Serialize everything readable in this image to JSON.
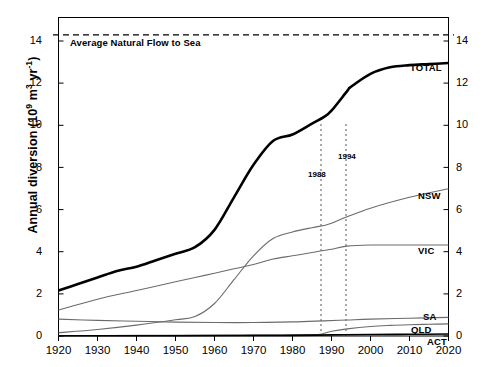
{
  "chart_data": {
    "type": "line",
    "title": "",
    "xlabel": "",
    "ylabel": "Annual diversion (10⁹ m³ yr⁻¹)",
    "ylabel_parts": {
      "pre": "Annual diversion (10",
      "sup1": "9",
      "mid": " m",
      "sup2": "3",
      "mid2": " yr",
      "sup3": "-1",
      "post": ")"
    },
    "xlim": [
      1920,
      2020
    ],
    "ylim": [
      0,
      14.7
    ],
    "xticks": [
      1920,
      1930,
      1940,
      1950,
      1960,
      1970,
      1980,
      1990,
      2000,
      2010,
      2020
    ],
    "yticks": [
      0,
      2,
      4,
      6,
      8,
      10,
      12,
      14
    ],
    "grid": false,
    "legend_position": "inline-right-of-curve",
    "reference_line": {
      "label": "Average Natural Flow to Sea",
      "value": 13.9,
      "style": "dashed"
    },
    "annotations": [
      {
        "label": "1988",
        "x": 1987.5,
        "style": "vertical-dotted"
      },
      {
        "label": "1994",
        "x": 1994,
        "style": "vertical-dotted"
      }
    ],
    "series": [
      {
        "name": "TOTAL",
        "emphasis": "bold",
        "color": "#000000",
        "x": [
          1920,
          1925,
          1930,
          1935,
          1940,
          1945,
          1950,
          1955,
          1960,
          1965,
          1970,
          1975,
          1980,
          1985,
          1988,
          1990,
          1994,
          1995,
          2000,
          2005,
          2010,
          2015,
          2020
        ],
        "values": [
          2.1,
          2.4,
          2.7,
          3.0,
          3.2,
          3.5,
          3.8,
          4.1,
          4.9,
          6.4,
          7.9,
          9.0,
          9.3,
          9.8,
          10.1,
          10.4,
          11.3,
          11.5,
          12.1,
          12.4,
          12.5,
          12.55,
          12.6
        ]
      },
      {
        "name": "NSW",
        "emphasis": "normal",
        "color": "#6b6b6b",
        "x": [
          1920,
          1930,
          1940,
          1950,
          1955,
          1960,
          1965,
          1970,
          1975,
          1980,
          1985,
          1988,
          1990,
          1994,
          2000,
          2010,
          2020
        ],
        "values": [
          0.15,
          0.3,
          0.5,
          0.75,
          0.9,
          1.5,
          2.6,
          3.7,
          4.5,
          4.8,
          5.0,
          5.1,
          5.2,
          5.5,
          5.9,
          6.4,
          6.8
        ]
      },
      {
        "name": "VIC",
        "emphasis": "normal",
        "color": "#6b6b6b",
        "x": [
          1920,
          1930,
          1940,
          1950,
          1955,
          1960,
          1965,
          1970,
          1975,
          1980,
          1985,
          1988,
          1990,
          1994,
          2000,
          2010,
          2020
        ],
        "values": [
          1.2,
          1.7,
          2.1,
          2.5,
          2.7,
          2.9,
          3.1,
          3.3,
          3.55,
          3.7,
          3.85,
          3.95,
          4.0,
          4.15,
          4.2,
          4.2,
          4.2
        ]
      },
      {
        "name": "SA",
        "emphasis": "normal",
        "color": "#6b6b6b",
        "x": [
          1920,
          1930,
          1940,
          1950,
          1960,
          1970,
          1980,
          1988,
          1994,
          2000,
          2010,
          2020
        ],
        "values": [
          0.78,
          0.72,
          0.68,
          0.64,
          0.62,
          0.62,
          0.65,
          0.7,
          0.74,
          0.78,
          0.82,
          0.86
        ]
      },
      {
        "name": "QLD",
        "emphasis": "normal",
        "color": "#6b6b6b",
        "x": [
          1920,
          1940,
          1960,
          1970,
          1980,
          1985,
          1987,
          1990,
          1994,
          2000,
          2005,
          2010,
          2015,
          2020
        ],
        "values": [
          0.02,
          0.03,
          0.04,
          0.05,
          0.06,
          0.07,
          0.08,
          0.22,
          0.33,
          0.44,
          0.49,
          0.52,
          0.54,
          0.56
        ]
      },
      {
        "name": "ACT",
        "emphasis": "normal",
        "color": "#000000",
        "x": [
          1920,
          1950,
          1970,
          1980,
          1990,
          2000,
          2010,
          2020
        ],
        "values": [
          0.01,
          0.012,
          0.02,
          0.03,
          0.05,
          0.07,
          0.08,
          0.09
        ]
      }
    ],
    "series_labels": [
      {
        "name": "TOTAL",
        "x": 410,
        "y": 62
      },
      {
        "name": "NSW",
        "x": 418,
        "y": 190
      },
      {
        "name": "VIC",
        "x": 418,
        "y": 245
      },
      {
        "name": "SA",
        "x": 423,
        "y": 312
      },
      {
        "name": "QLD",
        "x": 412,
        "y": 325
      },
      {
        "name": "ACT",
        "x": 428,
        "y": 337
      }
    ]
  }
}
